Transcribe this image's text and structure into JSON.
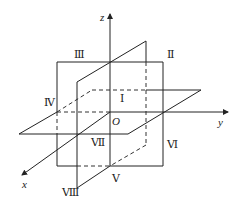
{
  "diagram": {
    "axes": {
      "x": "x",
      "y": "y",
      "z": "z",
      "origin": "O"
    },
    "octants": {
      "I": "Ⅰ",
      "II": "Ⅱ",
      "III": "Ⅲ",
      "IV": "Ⅳ",
      "V": "Ⅴ",
      "VI": "Ⅵ",
      "VII": "Ⅶ",
      "VIII": "Ⅷ"
    },
    "colors": {
      "line": "#222222",
      "background": "#ffffff"
    }
  }
}
